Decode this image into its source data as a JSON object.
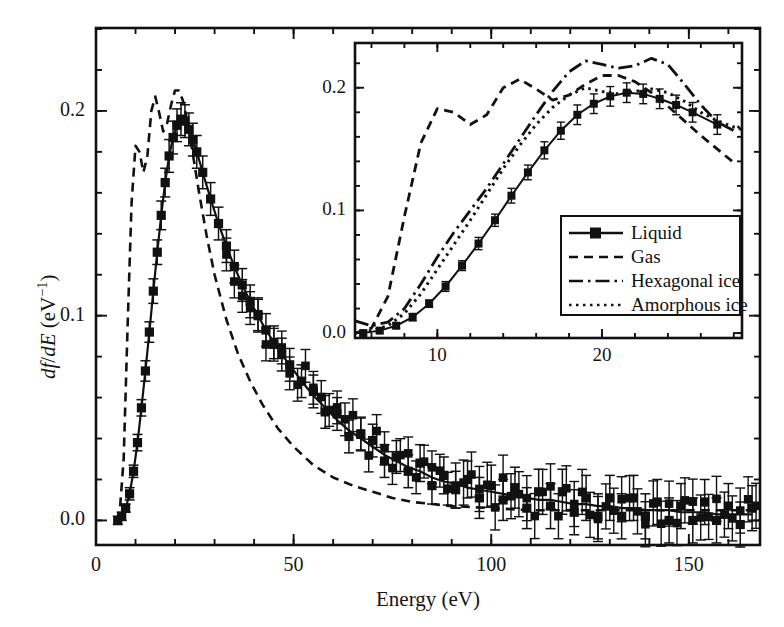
{
  "figure": {
    "type": "scientific-plot",
    "background": "#ffffff",
    "ink_color": "#111111"
  },
  "main_axes": {
    "xlabel": "Energy (eV)",
    "ylabel_parts": {
      "num": "df",
      "den": "dE",
      "unit": "(eV⁻¹)"
    },
    "ylabel_plain": "df/dE (eV⁻¹)",
    "xticks": [
      0,
      50,
      100,
      150
    ],
    "xtick_labels": [
      "0",
      "50",
      "100",
      "150"
    ],
    "yticks": [
      0.0,
      0.1,
      0.2
    ],
    "ytick_labels": [
      "0.0",
      "0.1",
      "0.2"
    ],
    "xlim": [
      0,
      168
    ],
    "ylim": [
      -0.012,
      0.2405
    ],
    "minor_x_interval": 10,
    "minor_y_interval": 0.02,
    "grid": false,
    "frame": true
  },
  "inset_axes": {
    "xticks": [
      10,
      20
    ],
    "xtick_labels": [
      "10",
      "20"
    ],
    "yticks": [
      0.0,
      0.1,
      0.2
    ],
    "ytick_labels": [
      "0.0",
      "0.1",
      "0.2"
    ],
    "xlim": [
      5.0,
      28.5
    ],
    "ylim": [
      -0.004,
      0.2365
    ],
    "minor_x_interval": 2,
    "minor_y_interval": 0.02,
    "grid": false,
    "frame": true
  },
  "legend": {
    "position": "inset-lower-right",
    "entries": [
      {
        "label": "Liquid",
        "style": "solid-with-square-markers",
        "marker": "filled-square"
      },
      {
        "label": "Gas",
        "style": "dashed",
        "marker": "none"
      },
      {
        "label": "Hexagonal ice",
        "style": "dashdot",
        "marker": "none"
      },
      {
        "label": "Amorphous ice",
        "style": "dotted",
        "marker": "none"
      }
    ]
  },
  "chart_data": {
    "type": "line",
    "title": "",
    "xlabel": "Energy (eV)",
    "ylabel": "df/dE (eV^-1)",
    "xlim": [
      0,
      168
    ],
    "ylim": [
      -0.012,
      0.2405
    ],
    "grid": false,
    "legend_position": "inset lower-right",
    "series": [
      {
        "name": "Liquid",
        "style": "solid-with-square-markers-and-errorbars",
        "x": [
          5.5,
          6.5,
          7.5,
          8.5,
          9.5,
          10.5,
          11.5,
          12.5,
          13.5,
          14.5,
          15.5,
          16.5,
          17.5,
          18.5,
          19.5,
          20.5,
          21.5,
          22.5,
          23.5,
          24.5,
          25.5,
          27,
          29,
          31,
          33,
          35,
          37,
          39,
          41,
          43,
          45,
          47,
          49,
          52,
          55,
          58,
          61,
          64,
          67,
          70,
          73,
          76,
          79,
          82,
          85,
          88,
          91,
          94,
          97,
          100,
          103,
          106,
          109,
          112,
          115,
          118,
          121,
          124,
          127,
          130,
          133,
          136,
          139,
          142,
          145,
          148,
          151,
          154,
          157,
          160,
          163,
          166
        ],
        "y": [
          0.0,
          0.002,
          0.006,
          0.013,
          0.024,
          0.038,
          0.055,
          0.073,
          0.092,
          0.112,
          0.131,
          0.149,
          0.165,
          0.178,
          0.187,
          0.193,
          0.196,
          0.195,
          0.191,
          0.186,
          0.18,
          0.17,
          0.157,
          0.145,
          0.134,
          0.124,
          0.115,
          0.107,
          0.1,
          0.093,
          0.087,
          0.081,
          0.076,
          0.068,
          0.061,
          0.055,
          0.049,
          0.044,
          0.04,
          0.036,
          0.032,
          0.029,
          0.026,
          0.024,
          0.021,
          0.019,
          0.018,
          0.016,
          0.015,
          0.014,
          0.013,
          0.012,
          0.011,
          0.01,
          0.01,
          0.009,
          0.008,
          0.008,
          0.007,
          0.007,
          0.006,
          0.006,
          0.005,
          0.005,
          0.005,
          0.004,
          0.004,
          0.004,
          0.003,
          0.003,
          0.003,
          0.003
        ],
        "yerr": [
          0.002,
          0.002,
          0.002,
          0.003,
          0.003,
          0.004,
          0.004,
          0.005,
          0.005,
          0.006,
          0.006,
          0.007,
          0.007,
          0.008,
          0.008,
          0.008,
          0.008,
          0.008,
          0.008,
          0.008,
          0.008,
          0.008,
          0.008,
          0.008,
          0.008,
          0.008,
          0.008,
          0.008,
          0.008,
          0.008,
          0.008,
          0.008,
          0.008,
          0.008,
          0.008,
          0.008,
          0.008,
          0.008,
          0.008,
          0.008,
          0.008,
          0.008,
          0.008,
          0.009,
          0.009,
          0.009,
          0.009,
          0.009,
          0.01,
          0.01,
          0.01,
          0.01,
          0.01,
          0.011,
          0.011,
          0.011,
          0.011,
          0.011,
          0.011,
          0.011,
          0.011,
          0.011,
          0.011,
          0.011,
          0.011,
          0.011,
          0.011,
          0.011,
          0.011,
          0.011,
          0.011,
          0.011
        ],
        "scatter_jitter": [
          0,
          0,
          0,
          0,
          0,
          0,
          0,
          0,
          0,
          0,
          0,
          0,
          0,
          0,
          0,
          0,
          0,
          0,
          0,
          0,
          0,
          0,
          0,
          0,
          0,
          0,
          0,
          0,
          0,
          0,
          0,
          0,
          0,
          0,
          0.002,
          -0.002,
          0.003,
          -0.003,
          0.002,
          0.003,
          -0.003,
          0.002,
          -0.002,
          0.004,
          -0.004,
          0.003,
          -0.003,
          0.004,
          -0.004,
          0.003,
          -0.003,
          0.004,
          -0.005,
          0.004,
          -0.003,
          0.005,
          -0.004,
          0.003,
          -0.005,
          0.004,
          -0.004,
          0.005,
          -0.003,
          0.004,
          -0.005,
          0.003,
          -0.004,
          0.005,
          -0.003,
          0.004,
          -0.005,
          0.003
        ]
      },
      {
        "name": "Gas",
        "style": "dashed",
        "x": [
          5,
          6,
          7,
          8,
          9,
          10,
          11,
          12,
          13,
          14,
          15,
          16,
          17,
          18,
          19,
          20,
          21,
          22,
          23,
          24,
          25,
          26,
          28,
          30,
          33,
          36,
          39,
          42,
          46,
          50,
          55,
          60,
          65,
          70,
          75,
          80,
          85,
          90,
          100,
          110,
          120,
          130,
          140,
          150,
          160,
          168
        ],
        "y": [
          0.0,
          0.004,
          0.03,
          0.095,
          0.155,
          0.183,
          0.18,
          0.17,
          0.178,
          0.2,
          0.207,
          0.199,
          0.19,
          0.194,
          0.203,
          0.21,
          0.21,
          0.205,
          0.196,
          0.185,
          0.173,
          0.161,
          0.139,
          0.12,
          0.098,
          0.081,
          0.068,
          0.057,
          0.045,
          0.036,
          0.027,
          0.021,
          0.017,
          0.014,
          0.011,
          0.009,
          0.008,
          0.007,
          0.006,
          0.005,
          0.005,
          0.005,
          0.005,
          0.005,
          0.005,
          0.005
        ]
      },
      {
        "name": "Hexagonal ice",
        "style": "dashdot",
        "x": [
          5,
          6,
          7,
          8,
          9,
          10,
          11,
          12,
          13,
          14,
          15,
          16,
          17,
          18,
          19,
          20,
          21,
          22,
          23,
          24,
          25,
          26,
          27,
          28,
          28.5
        ],
        "y": [
          0.01,
          0.006,
          0.009,
          0.02,
          0.04,
          0.062,
          0.082,
          0.1,
          0.118,
          0.138,
          0.158,
          0.178,
          0.197,
          0.213,
          0.222,
          0.219,
          0.216,
          0.218,
          0.224,
          0.219,
          0.203,
          0.186,
          0.172,
          0.165,
          0.17
        ]
      },
      {
        "name": "Amorphous ice",
        "style": "dotted",
        "x": [
          5,
          6,
          7,
          8,
          9,
          10,
          11,
          12,
          13,
          14,
          15,
          16,
          17,
          18,
          19,
          20,
          21,
          22,
          23,
          24,
          25,
          26,
          27,
          28,
          28.5
        ],
        "y": [
          0.0,
          0.002,
          0.006,
          0.016,
          0.032,
          0.052,
          0.072,
          0.092,
          0.113,
          0.134,
          0.153,
          0.17,
          0.184,
          0.194,
          0.2,
          0.197,
          0.195,
          0.197,
          0.199,
          0.196,
          0.189,
          0.18,
          0.173,
          0.168,
          0.166
        ]
      }
    ]
  }
}
